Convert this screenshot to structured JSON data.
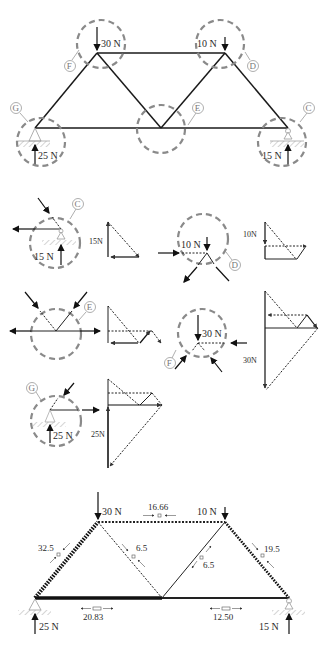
{
  "truss": {
    "loads": {
      "F": "30 N",
      "D": "10 N"
    },
    "reactions": {
      "G": "25 N",
      "C": "15 N"
    },
    "node_labels": {
      "F": "F",
      "D": "D",
      "E": "E",
      "G": "G",
      "C": "C"
    }
  },
  "joints": {
    "C": {
      "label": "C",
      "reaction": "15 N",
      "polygon_label": "15N"
    },
    "D": {
      "label": "D",
      "load": "10 N",
      "polygon_label": "10N"
    },
    "E": {
      "label": "E"
    },
    "F": {
      "label": "F",
      "load": "30 N",
      "polygon_label": "30N"
    },
    "G": {
      "label": "G",
      "reaction": "25 N",
      "polygon_label": "25N"
    }
  },
  "result": {
    "loads": {
      "F": "30 N",
      "D": "10 N"
    },
    "reactions": {
      "G": "25 N",
      "C": "15 N"
    },
    "members": {
      "FD": "16.66",
      "GF": "32.5",
      "FE": "6.5",
      "ED": "6.5",
      "DC": "19.5",
      "GE": "20.83",
      "EC": "12.50"
    }
  }
}
